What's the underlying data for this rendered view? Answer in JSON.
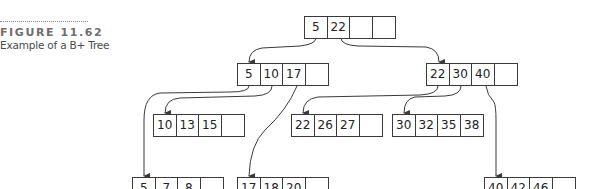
{
  "caption": {
    "figure_label": "FIGURE 11.62",
    "description": "Example of a B+ Tree"
  },
  "colors": {
    "line": "#3a3a3a",
    "caption_label": "#6e6e6e",
    "caption_text": "#4a4a4a"
  },
  "tree": {
    "root": {
      "keys": [
        "5",
        "22",
        "",
        ""
      ]
    },
    "internal_left": {
      "keys": [
        "5",
        "10",
        "17",
        ""
      ]
    },
    "internal_right": {
      "keys": [
        "22",
        "30",
        "40",
        ""
      ]
    },
    "leaves": [
      {
        "keys": [
          "10",
          "13",
          "15",
          ""
        ]
      },
      {
        "keys": [
          "22",
          "26",
          "27",
          ""
        ]
      },
      {
        "keys": [
          "30",
          "32",
          "35",
          "38"
        ]
      },
      {
        "keys": [
          "5",
          "7",
          "8",
          ""
        ]
      },
      {
        "keys": [
          "17",
          "18",
          "20",
          ""
        ]
      },
      {
        "keys": [
          "40",
          "42",
          "46",
          ""
        ]
      }
    ]
  }
}
